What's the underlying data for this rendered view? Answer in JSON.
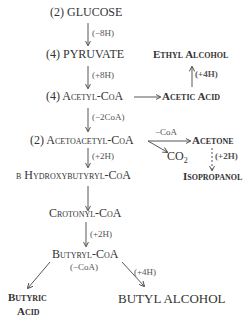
{
  "nodes": {
    "glucose": "(2) GLUCOSE",
    "pyruvate": "(4) PYRUVATE",
    "acetyl_coa": "(4) Acetyl-CoA",
    "acetoacetyl_coa": "(2) Acetoacetyl-CoA",
    "hydroxybutyryl_coa": "β Hydroxybutyryl-CoA",
    "crotonyl_coa": "Crotonyl-CoA",
    "butyryl_coa": "Butyryl-CoA",
    "butyric_acid_1": "Butyric",
    "butyric_acid_2": "Acid",
    "butyl_alcohol": "BUTYL ALCOHOL",
    "ethyl_alcohol": "Ethyl Alcohol",
    "acetic_acid": "Acetic Acid",
    "acetone": "Acetone",
    "isopropanol": "Isopropanol",
    "co2": "CO",
    "co2_sub": "2"
  },
  "labels": {
    "minus_8h": "(−8H)",
    "plus_8h": "(+8H)",
    "minus_2coa": "(−2CoA)",
    "plus_2h_a": "(+2H)",
    "plus_2h_b": "(+2H)",
    "minus_coa": "(−CoA)",
    "plus_4h_butyl": "(+4H)",
    "plus_4h_ethyl": "(+4H)",
    "minus_coa_acetone": "−CoA",
    "plus_2h_iso": "(+2H)"
  }
}
